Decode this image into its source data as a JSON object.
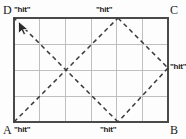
{
  "figure": {
    "colors": {
      "border": "#4a4a4a",
      "grid": "#b8b8b8",
      "dash": "#3a3a3a",
      "text": "#1a1a1a",
      "background": "#fdfdfd",
      "cursor_fill": "#2b2b2b",
      "cursor_outline": "#ffffff"
    }
  },
  "rect": {
    "x": 14,
    "y": 18,
    "width": 154,
    "height": 104,
    "cols": 6,
    "rows": 4
  },
  "vertices": [
    {
      "id": "D",
      "label": "D",
      "corner": "top-left"
    },
    {
      "id": "C",
      "label": "C",
      "corner": "top-right"
    },
    {
      "id": "A",
      "label": "A",
      "corner": "bottom-left"
    },
    {
      "id": "B",
      "label": "B",
      "corner": "bottom-right"
    }
  ],
  "hits": [
    {
      "id": "hit-D",
      "label": "\"hit\"",
      "at": "top-left-corner"
    },
    {
      "id": "hit-top",
      "label": "\"hit\"",
      "at": "top-edge-midpoint"
    },
    {
      "id": "hit-right",
      "label": "\"hit\"",
      "at": "right-edge-midpoint"
    },
    {
      "id": "hit-bottom",
      "label": "\"hit\"",
      "at": "bottom-edge-midpoint"
    },
    {
      "id": "hit-A",
      "label": "\"hit\"",
      "at": "bottom-left-corner"
    }
  ],
  "path": {
    "style": "dashed",
    "points": [
      {
        "x": 14,
        "y": 122
      },
      {
        "x": 118,
        "y": 18
      },
      {
        "x": 168,
        "y": 68
      },
      {
        "x": 118,
        "y": 122
      },
      {
        "x": 14,
        "y": 18
      }
    ]
  },
  "cursor": {
    "x": 20,
    "y": 24,
    "name": "mouse-pointer"
  }
}
